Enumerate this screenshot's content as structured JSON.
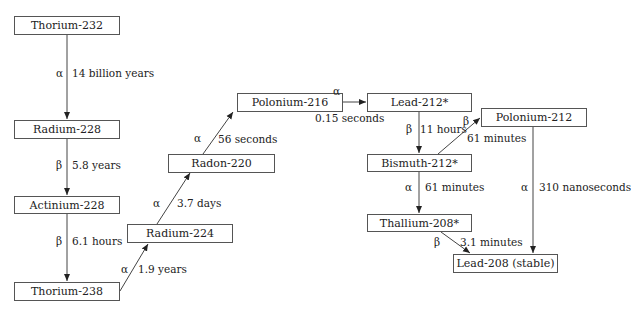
{
  "nodes": {
    "th232": "Thorium-232",
    "ra228": "Radium-228",
    "ac228": "Actinium-228",
    "th238": "Thorium-238",
    "ra224": "Radium-224",
    "rn220": "Radon-220",
    "po216": "Polonium-216",
    "pb212": "Lead-212*",
    "bi212": "Bismuth-212*",
    "po212": "Polonium-212",
    "tl208": "Thallium-208*",
    "pb208": "Lead-208 (stable)"
  },
  "edges": [
    {
      "from": "Thorium-232",
      "to": "Radium-228",
      "decay": "α",
      "half_life": "14 billion years"
    },
    {
      "from": "Radium-228",
      "to": "Actinium-228",
      "decay": "β",
      "half_life": "5.8 years"
    },
    {
      "from": "Actinium-228",
      "to": "Thorium-238",
      "decay": "β",
      "half_life": "6.1 hours"
    },
    {
      "from": "Thorium-238",
      "to": "Radium-224",
      "decay": "α",
      "half_life": "1.9 years"
    },
    {
      "from": "Radium-224",
      "to": "Radon-220",
      "decay": "α",
      "half_life": "3.7 days"
    },
    {
      "from": "Radon-220",
      "to": "Polonium-216",
      "decay": "α",
      "half_life": "56 seconds"
    },
    {
      "from": "Polonium-216",
      "to": "Lead-212*",
      "decay": "α",
      "half_life": "0.15 seconds"
    },
    {
      "from": "Lead-212*",
      "to": "Bismuth-212*",
      "decay": "β",
      "half_life": "11 hours"
    },
    {
      "from": "Bismuth-212*",
      "to": "Polonium-212",
      "decay": "β",
      "half_life": "61 minutes"
    },
    {
      "from": "Bismuth-212*",
      "to": "Thallium-208*",
      "decay": "α",
      "half_life": "61 minutes"
    },
    {
      "from": "Polonium-212",
      "to": "Lead-208 (stable)",
      "decay": "α",
      "half_life": "310 nanoseconds"
    },
    {
      "from": "Thallium-208*",
      "to": "Lead-208 (stable)",
      "decay": "β",
      "half_life": "3.1 minutes"
    }
  ]
}
